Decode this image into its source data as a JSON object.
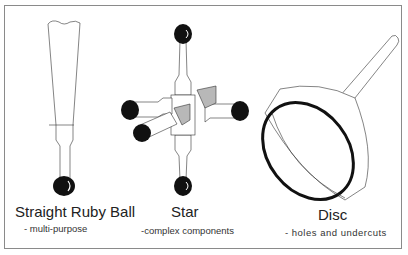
{
  "probes": [
    {
      "name": "Straight Ruby Ball",
      "description": "- multi-purpose"
    },
    {
      "name": "Star",
      "description": "-complex components"
    },
    {
      "name": "Disc",
      "description": "- holes and undercuts"
    }
  ],
  "colors": {
    "frame": "#8a8a8a",
    "ball": "#111111",
    "line": "#333333",
    "shade": "#b8b8b8"
  }
}
